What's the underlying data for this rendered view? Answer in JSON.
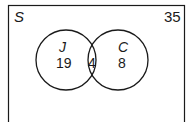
{
  "diagram": {
    "type": "venn",
    "universal_set_label": "S",
    "universal_total": "35",
    "sets": [
      {
        "label": "J",
        "only_count": "19"
      },
      {
        "label": "C",
        "only_count": "8"
      }
    ],
    "intersection_count": "4",
    "stroke_color": "#1a1a1a"
  }
}
